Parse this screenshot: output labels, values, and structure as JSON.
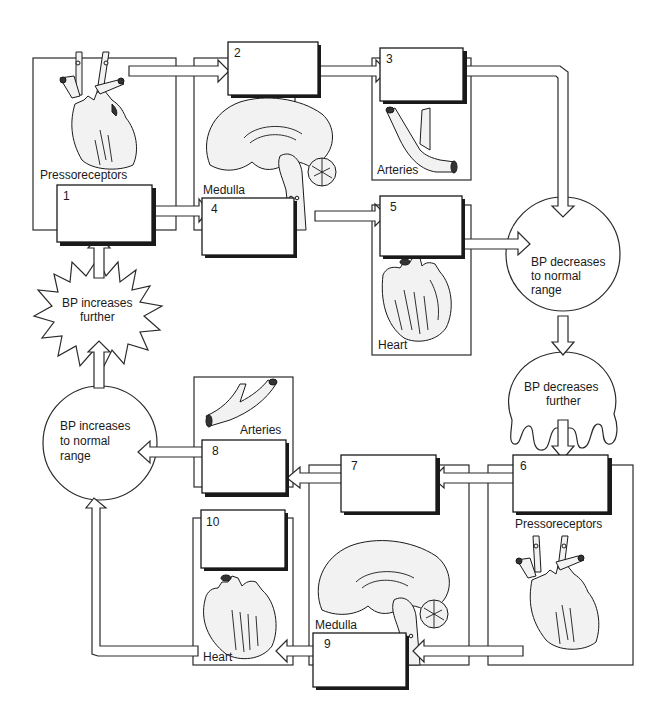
{
  "diagram": {
    "colors": {
      "line": "#2a2a2a",
      "background": "#ffffff",
      "text": "#1a1a1a"
    },
    "numbered_boxes": [
      {
        "id": 1,
        "label": "1",
        "text": ""
      },
      {
        "id": 2,
        "label": "2",
        "text": ""
      },
      {
        "id": 3,
        "label": "3",
        "text": ""
      },
      {
        "id": 4,
        "label": "4",
        "text": ""
      },
      {
        "id": 5,
        "label": "5",
        "text": ""
      },
      {
        "id": 6,
        "label": "6",
        "text": ""
      },
      {
        "id": 7,
        "label": "7",
        "text": ""
      },
      {
        "id": 8,
        "label": "8",
        "text": ""
      },
      {
        "id": 9,
        "label": "9",
        "text": ""
      },
      {
        "id": 10,
        "label": "10",
        "text": ""
      }
    ],
    "panels": {
      "pressoreceptors_top": {
        "label": "Pressoreceptors",
        "icon": "heart-aorta-icon"
      },
      "medulla_top": {
        "label": "Medulla",
        "icon": "brain-sagittal-icon"
      },
      "arteries_top": {
        "label": "Arteries",
        "icon": "artery-branch-icon"
      },
      "heart_top": {
        "label": "Heart",
        "icon": "heart-icon"
      },
      "pressoreceptors_bottom": {
        "label": "Pressoreceptors",
        "icon": "heart-aorta-icon"
      },
      "medulla_bottom": {
        "label": "Medulla",
        "icon": "brain-sagittal-icon"
      },
      "arteries_bottom": {
        "label": "Arteries",
        "icon": "artery-branch-icon"
      },
      "heart_bottom": {
        "label": "Heart",
        "icon": "heart-icon"
      }
    },
    "states": {
      "bp_increases_further": {
        "line1": "BP increases",
        "line2": "further",
        "shape": "starburst"
      },
      "bp_decreases_normal": {
        "line1": "BP decreases",
        "line2": "to normal",
        "line3": "range",
        "shape": "circle"
      },
      "bp_decreases_further": {
        "line1": "BP decreases",
        "line2": "further",
        "shape": "drip-blob"
      },
      "bp_increases_normal": {
        "line1": "BP increases",
        "line2": "to normal",
        "line3": "range",
        "shape": "circle"
      }
    },
    "flow": [
      "bp_increases_further -> 1",
      "1 -> 2",
      "1 -> 4",
      "2 -> 3",
      "4 -> 5",
      "3 -> bp_decreases_normal",
      "5 -> bp_decreases_normal",
      "bp_decreases_normal -> bp_decreases_further",
      "bp_decreases_further -> 6",
      "6 -> 7",
      "6 -> 9",
      "7 -> 8",
      "9 -> 10",
      "8 -> bp_increases_normal",
      "10 -> bp_increases_normal",
      "bp_increases_normal -> bp_increases_further"
    ]
  }
}
